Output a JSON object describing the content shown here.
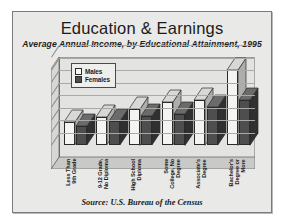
{
  "chart_data": {
    "type": "bar",
    "title": "Education & Earnings",
    "subtitle": "Average Annual Income, by Educational Attainment, 1995",
    "source": "Source:  U.S. Bureau of the Census",
    "xlabel": "",
    "ylabel": "",
    "ylim": [
      0,
      70000
    ],
    "ytick_step": 10000,
    "ytick_labels": [
      "$70,000",
      "$60,000",
      "$50,000",
      "$40,000",
      "$30,000",
      "$20,000",
      "$10,000",
      "$0"
    ],
    "ytick_values": [
      70000,
      60000,
      50000,
      40000,
      30000,
      20000,
      10000,
      0
    ],
    "grid": true,
    "legend_position": "top-left",
    "style": "3d-column",
    "categories": [
      "Less Than\n9th Grade",
      "9-12 Grade,\nNo Diploma",
      "High School\nDiploma",
      "Some\nCollege, No\nDegree",
      "Associate's\nDegree",
      "Bachelor's\nDegree or\nMore"
    ],
    "series": [
      {
        "name": "Males",
        "color": "#f4f4f2",
        "values": [
          18000,
          22000,
          29000,
          34000,
          36000,
          60000
        ]
      },
      {
        "name": "Females",
        "color": "#4e4e4e",
        "values": [
          15000,
          19000,
          23000,
          25000,
          30000,
          36000
        ]
      }
    ]
  }
}
